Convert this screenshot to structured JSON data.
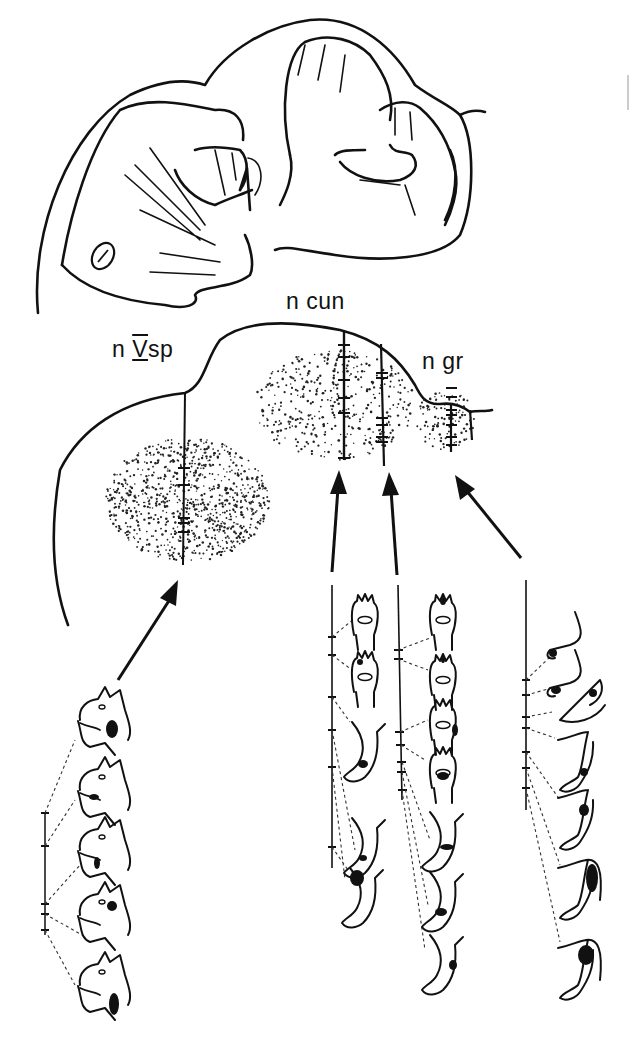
{
  "figure": {
    "top_illustration": "cat-head-and-forepaws-drawing",
    "nuclei": [
      {
        "id": "n5sp",
        "label": "n ̅V̅sp",
        "text": "n Ⅴ sp",
        "display_prefix": "n",
        "display_roman": "V",
        "display_suffix": "sp"
      },
      {
        "id": "ncun",
        "label": "n cun"
      },
      {
        "id": "ngr",
        "label": "n gr"
      }
    ],
    "receptive_field_columns": [
      {
        "target": "n Vsp",
        "body_part": "face",
        "count": 5
      },
      {
        "target": "n cun",
        "body_part": "forepaw-and-hindlimb",
        "count": 6
      },
      {
        "target": "n cun",
        "body_part": "forepaw-and-hindlimb",
        "count": 7
      },
      {
        "target": "n gr",
        "body_part": "hindlimb-and-tail",
        "count": 7
      }
    ],
    "colors": {
      "ink": "#111111",
      "background": "#ffffff"
    }
  }
}
